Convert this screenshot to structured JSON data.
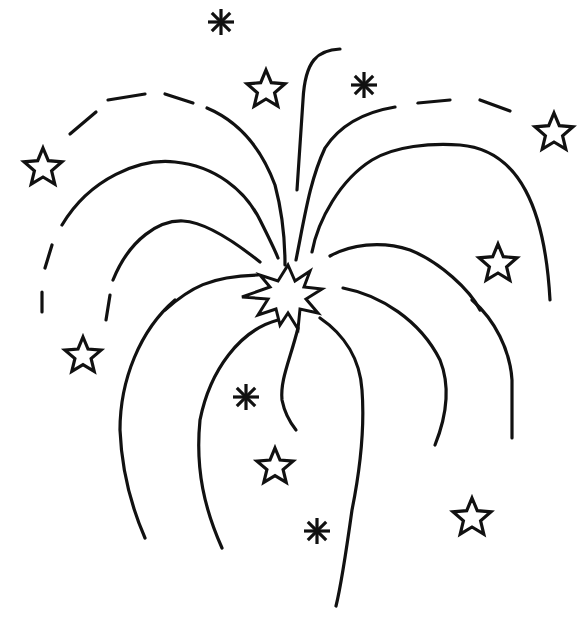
{
  "image": {
    "subject": "Fireworks line drawing",
    "background": "#ffffff",
    "ink": "#111111"
  },
  "stars": [
    {
      "x": 266,
      "y": 90,
      "r": 20
    },
    {
      "x": 43,
      "y": 168,
      "r": 20
    },
    {
      "x": 554,
      "y": 133,
      "r": 20
    },
    {
      "x": 498,
      "y": 264,
      "r": 20
    },
    {
      "x": 83,
      "y": 356,
      "r": 19
    },
    {
      "x": 275,
      "y": 467,
      "r": 19
    },
    {
      "x": 472,
      "y": 518,
      "r": 20
    }
  ],
  "asterisks": [
    {
      "x": 221,
      "y": 22,
      "r": 13
    },
    {
      "x": 364,
      "y": 85,
      "r": 13
    },
    {
      "x": 246,
      "y": 397,
      "r": 13
    },
    {
      "x": 317,
      "y": 531,
      "r": 13
    }
  ],
  "burst": {
    "x": 288,
    "y": 295
  }
}
